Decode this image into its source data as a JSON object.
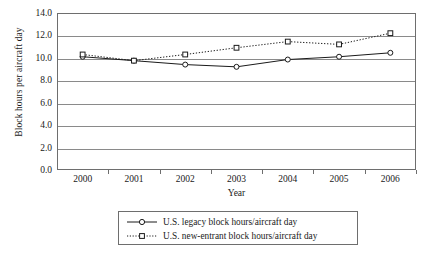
{
  "chart_data": {
    "type": "line",
    "title": "",
    "xlabel": "Year",
    "ylabel": "Block hours per aircraft day",
    "categories": [
      "2000",
      "2001",
      "2002",
      "2003",
      "2004",
      "2005",
      "2006"
    ],
    "x": [
      2000,
      2001,
      2002,
      2003,
      2004,
      2005,
      2006
    ],
    "ylim": [
      0.0,
      14.0
    ],
    "ytick_step": 2.0,
    "ytick_labels": [
      "0.0",
      "2.0",
      "4.0",
      "6.0",
      "8.0",
      "10.0",
      "12.0",
      "14.0"
    ],
    "ytick_values": [
      0.0,
      2.0,
      4.0,
      6.0,
      8.0,
      10.0,
      12.0,
      14.0
    ],
    "grid": "horizontal",
    "legend_position": "bottom",
    "series": [
      {
        "name": "U.S. legacy block hours/aircraft day",
        "values": [
          10.1,
          9.75,
          9.4,
          9.2,
          9.85,
          10.1,
          10.45
        ],
        "line_style": "solid",
        "marker": "circle",
        "color": "#1a1a1a"
      },
      {
        "name": "U.S. new-entrant block hours/aircraft day",
        "values": [
          10.3,
          9.75,
          10.3,
          10.9,
          11.45,
          11.2,
          12.2
        ],
        "line_style": "dotted",
        "marker": "square",
        "color": "#1a1a1a"
      }
    ]
  },
  "legend": {
    "items": [
      {
        "label": "U.S. legacy block hours/aircraft day",
        "key": "solid-line-circle-marker"
      },
      {
        "label": "U.S. new-entrant block hours/aircraft day",
        "key": "dotted-line-square-marker"
      }
    ]
  }
}
